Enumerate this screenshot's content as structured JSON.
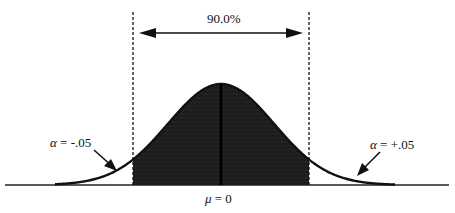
{
  "diagram": {
    "type": "normal-distribution",
    "interval_label": "90.0%",
    "mean_label_symbol": "μ",
    "mean_label_rest": " = 0",
    "left_tail": {
      "symbol": "α",
      "rest": " = -.05"
    },
    "right_tail": {
      "symbol": "α",
      "rest": " = +.05"
    },
    "colors": {
      "fill": "#1a1a1a",
      "line": "#111111",
      "background": "#ffffff"
    }
  }
}
